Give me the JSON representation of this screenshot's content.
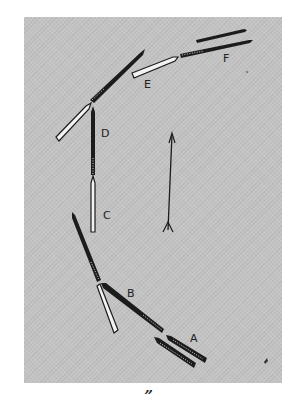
{
  "figure": {
    "background_color": "#c3c3c3",
    "ink_color": "#1c1c1c",
    "caption": "”",
    "labels": {
      "A": "A",
      "B": "B",
      "C": "C",
      "D": "D",
      "E": "E",
      "F": "F"
    },
    "arrow": "up-arrow"
  }
}
